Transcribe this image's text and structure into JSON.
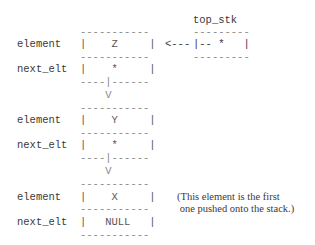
{
  "diagram": {
    "type": "linked-list stack",
    "pointer": {
      "label": "top_stk",
      "top_border": "---------",
      "content": "|-- *   |",
      "bottom_border": "---------",
      "arrow": "<---"
    },
    "field_labels": {
      "element": "element",
      "next_elt": "next_elt"
    },
    "nodes": [
      {
        "element": "Z",
        "next_elt": "*",
        "element_row": "|    Z     |",
        "next_row": "|    *     |"
      },
      {
        "element": "Y",
        "next_elt": "*",
        "element_row": "|    Y     |",
        "next_row": "|    *     |"
      },
      {
        "element": "X",
        "next_elt": "NULL",
        "element_row": "|    X     |",
        "next_row": "|   NULL   |"
      }
    ],
    "borders": {
      "full": "-----------",
      "split": "----|------",
      "down_arrow": "    V"
    },
    "note": {
      "line1": "(This element is the first",
      "line2": " one pushed onto the stack.)"
    }
  }
}
